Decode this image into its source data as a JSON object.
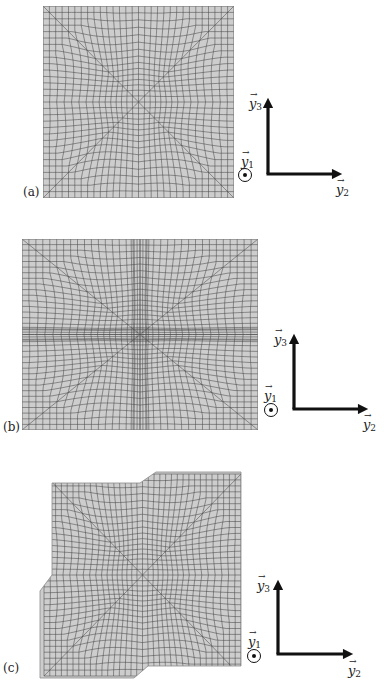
{
  "figure": {
    "panels": [
      {
        "id": "a",
        "label": "(a)",
        "description": "Undeformed square finite-element mesh with radial star pattern",
        "axes": {
          "y1": "y",
          "y1_sub": "1",
          "y2": "y",
          "y2_sub": "2",
          "y3": "y",
          "y3_sub": "3",
          "vec": "→",
          "out_of_plane": "⊙"
        }
      },
      {
        "id": "b",
        "label": "(b)",
        "description": "Mesh with refined horizontal band at mid-height",
        "axes": {
          "y1": "y",
          "y1_sub": "1",
          "y2": "y",
          "y2_sub": "2",
          "y3": "y",
          "y3_sub": "3",
          "vec": "→",
          "out_of_plane": "⊙"
        }
      },
      {
        "id": "c",
        "label": "(c)",
        "description": "Deformed mesh with shear offsets along vertical and horizontal bands",
        "axes": {
          "y1": "y",
          "y1_sub": "1",
          "y2": "y",
          "y2_sub": "2",
          "y3": "y",
          "y3_sub": "3",
          "vec": "→",
          "out_of_plane": "⊙"
        }
      }
    ],
    "colors": {
      "mesh_fill": "#cdcdcd",
      "mesh_line": "#4a4a4a",
      "arrow": "#111111"
    }
  }
}
